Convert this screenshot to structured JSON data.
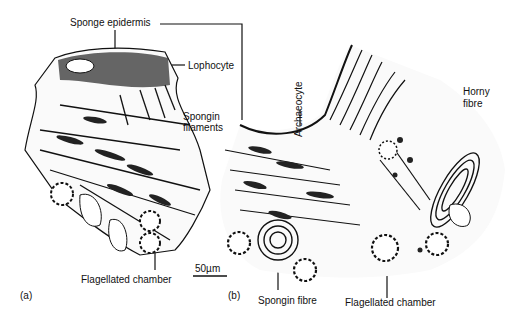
{
  "figure": {
    "panel_a_label": "(a)",
    "panel_b_label": "(b)",
    "scale_bar": "50µm",
    "labels": {
      "sponge_epidermis": "Sponge epidermis",
      "lophocyte": "Lophocyte",
      "spongin_filaments_1": "Spongin",
      "spongin_filaments_2": "filaments",
      "archaeocyte": "Archaeocyte",
      "horny_fibre_1": "Horny",
      "horny_fibre_2": "fibre",
      "flagellated_chamber_a": "Flagellated chamber",
      "spongin_fibre": "Spongin fibre",
      "flagellated_chamber_b": "Flagellated chamber"
    },
    "colors": {
      "ink": "#111111",
      "paper": "#ffffff"
    }
  }
}
